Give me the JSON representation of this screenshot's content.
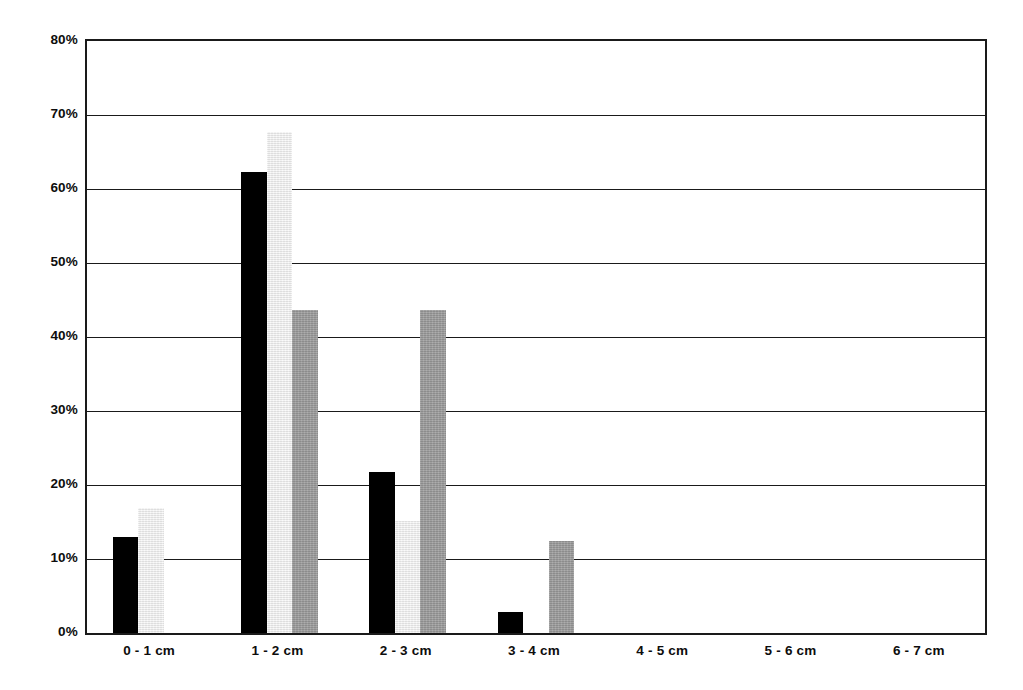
{
  "chart_data": {
    "type": "bar",
    "title": "",
    "subtitle": "",
    "xlabel": "",
    "ylabel": "",
    "categories": [
      "0 - 1 cm",
      "1 - 2 cm",
      "2 - 3 cm",
      "3 - 4 cm",
      "4 - 5 cm",
      "5 - 6 cm",
      "6 - 7 cm"
    ],
    "series": [
      {
        "name": "series-1",
        "color": "#000000",
        "style": "black",
        "values": [
          13.0,
          62.3,
          21.7,
          2.8,
          0,
          0,
          0
        ]
      },
      {
        "name": "series-2",
        "color": "#ebebeb",
        "style": "light",
        "values": [
          16.9,
          67.7,
          15.1,
          0,
          0,
          0,
          0
        ]
      },
      {
        "name": "series-3",
        "color": "#999999",
        "style": "gray",
        "values": [
          0,
          43.7,
          43.7,
          12.4,
          0,
          0,
          0
        ]
      }
    ],
    "ylim": [
      0,
      80
    ],
    "ytick_values": [
      0,
      10,
      20,
      30,
      40,
      50,
      60,
      70,
      80
    ],
    "ytick_labels": [
      "0%",
      "10%",
      "20%",
      "30%",
      "40%",
      "50%",
      "60%",
      "70%",
      "80%"
    ],
    "grid": true,
    "grid_axis": "y",
    "legend": false,
    "legend_position": "none",
    "annotations": []
  },
  "axis": {
    "frame_color": "#1a1a1a",
    "background": "#ffffff"
  }
}
